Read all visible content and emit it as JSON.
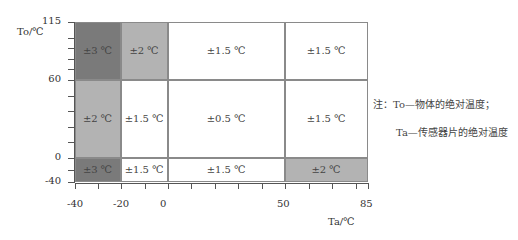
{
  "chart_data": {
    "type": "heatmap",
    "title": "",
    "xlabel": "Ta/℃",
    "ylabel": "To/℃",
    "xlim": [
      -40,
      85
    ],
    "ylim": [
      -40,
      115
    ],
    "x_ticks": [
      "-40",
      "-20",
      "0",
      "50",
      "85"
    ],
    "y_ticks": [
      "115",
      "60",
      "0",
      "-40"
    ],
    "x_bins": [
      [
        -40,
        -20
      ],
      [
        -20,
        0
      ],
      [
        0,
        50
      ],
      [
        50,
        85
      ]
    ],
    "y_bins": [
      [
        60,
        115
      ],
      [
        0,
        60
      ],
      [
        -40,
        0
      ]
    ],
    "cells": [
      {
        "ta": [
          -40,
          -20
        ],
        "to": [
          60,
          115
        ],
        "value": "±3 ℃",
        "color": "#7a7a7a"
      },
      {
        "ta": [
          -20,
          0
        ],
        "to": [
          60,
          115
        ],
        "value": "±2 ℃",
        "color": "#b3b3b3"
      },
      {
        "ta": [
          0,
          50
        ],
        "to": [
          60,
          115
        ],
        "value": "±1.5 ℃",
        "color": "#ffffff"
      },
      {
        "ta": [
          50,
          85
        ],
        "to": [
          60,
          115
        ],
        "value": "±1.5 ℃",
        "color": "#ffffff"
      },
      {
        "ta": [
          -40,
          -20
        ],
        "to": [
          0,
          60
        ],
        "value": "±2 ℃",
        "color": "#b3b3b3"
      },
      {
        "ta": [
          -20,
          0
        ],
        "to": [
          0,
          60
        ],
        "value": "±1.5 ℃",
        "color": "#ffffff"
      },
      {
        "ta": [
          0,
          50
        ],
        "to": [
          0,
          60
        ],
        "value": "±0.5 ℃",
        "color": "#ffffff"
      },
      {
        "ta": [
          50,
          85
        ],
        "to": [
          0,
          60
        ],
        "value": "±1.5 ℃",
        "color": "#ffffff"
      },
      {
        "ta": [
          -40,
          -20
        ],
        "to": [
          -40,
          0
        ],
        "value": "±3 ℃",
        "color": "#7a7a7a"
      },
      {
        "ta": [
          -20,
          0
        ],
        "to": [
          -40,
          0
        ],
        "value": "±1.5 ℃",
        "color": "#ffffff"
      },
      {
        "ta": [
          0,
          50
        ],
        "to": [
          -40,
          0
        ],
        "value": "±1.5 ℃",
        "color": "#ffffff"
      },
      {
        "ta": [
          50,
          85
        ],
        "to": [
          -40,
          0
        ],
        "value": "±2 ℃",
        "color": "#b3b3b3"
      }
    ],
    "annotations": [
      "注：To—物体的绝对温度；",
      "Ta—传感器片的绝对温度"
    ],
    "grid": true,
    "legend": "none"
  },
  "labels": {
    "ylabel": "To/℃",
    "xlabel": "Ta/℃",
    "note_line1": "注：To—物体的绝对温度；",
    "note_line2": "Ta—传感器片的绝对温度"
  }
}
